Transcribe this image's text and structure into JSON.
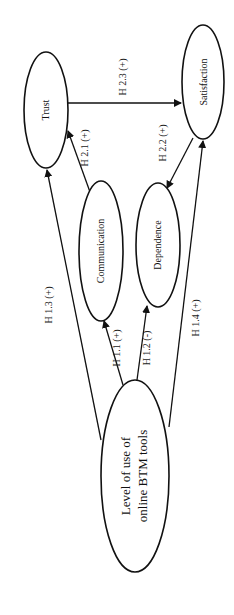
{
  "diagram": {
    "type": "path-model",
    "orientation": "rotated-90-ccw",
    "colors": {
      "stroke": "#111111",
      "background": "#ffffff"
    },
    "nodes": {
      "trust": {
        "label": "Trust"
      },
      "satisfaction": {
        "label": "Satisfaction"
      },
      "communication": {
        "label": "Communication"
      },
      "dependence": {
        "label": "Dependence"
      },
      "level_of_use": {
        "label_line1": "Level of use of",
        "label_line2": "online BTM tools"
      }
    },
    "edges": [
      {
        "id": "h11",
        "from": "level_of_use",
        "to": "communication",
        "label": "H 1.1 (+)"
      },
      {
        "id": "h12",
        "from": "level_of_use",
        "to": "dependence",
        "label": "H 1.2 (-)"
      },
      {
        "id": "h13",
        "from": "level_of_use",
        "to": "trust",
        "label": "H 1.3 (+)"
      },
      {
        "id": "h14",
        "from": "level_of_use",
        "to": "satisfaction",
        "label": "H 1.4 (+)"
      },
      {
        "id": "h21",
        "from": "communication",
        "to": "trust",
        "label": "H 2.1 (+)"
      },
      {
        "id": "h22",
        "from": "satisfaction",
        "to": "dependence",
        "label": "H 2.2 (+)"
      },
      {
        "id": "h23",
        "from": "trust",
        "to": "satisfaction",
        "label": "H 2.3 (+)"
      }
    ]
  }
}
